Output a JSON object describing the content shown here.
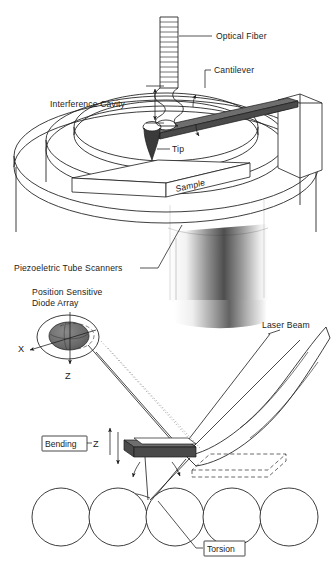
{
  "figure": {
    "background": "#ffffff",
    "ink_color": "#1b1b1b"
  },
  "top_panel": {
    "name": "interferometric-afm-head",
    "labels": {
      "optical_fiber": "Optical Fiber",
      "cantilever": "Cantilever",
      "interference_cavity": "Interference Cavity",
      "tip": "Tip",
      "sample": "Sample",
      "piezo_scanners": "Piezoeletric Tube Scanners"
    }
  },
  "bottom_panel": {
    "name": "beam-deflection-detection",
    "labels": {
      "detector": "Position Sensitive\nDiode Array",
      "detector_line1": "Position Sensitive",
      "detector_line2": "Diode Array",
      "laser_beam": "Laser Beam",
      "bending": "Bending",
      "torsion": "Torsion",
      "axis_x": "X",
      "axis_z_detector": "Z",
      "axis_z_bending": "Z"
    },
    "atoms": {
      "count": 5,
      "label": "surface atoms"
    }
  }
}
